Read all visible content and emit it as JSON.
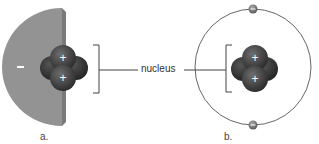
{
  "diagram": {
    "center_label": "nucleus",
    "panels": [
      {
        "id": "a",
        "caption": "a.",
        "cloud_sign": "−",
        "nucleus_signs": [
          "+",
          "+"
        ],
        "description": "electron cloud model (half sphere) with nucleus of two protons and two neutrons"
      },
      {
        "id": "b",
        "caption": "b.",
        "electron_sign": "−",
        "nucleus_signs": [
          "+",
          "+"
        ],
        "electrons": 2,
        "description": "Bohr-style orbit model with two electrons on a circular orbit around nucleus"
      }
    ],
    "colors": {
      "cloud": "#8f8f8f",
      "cloud_edge": "#7a7a7a",
      "nucleus_dark": "#3f3f3f",
      "nucleus_mid": "#5a5a5a",
      "orbit": "#555555",
      "electron": "#7d7d7d",
      "bracket": "#444444"
    }
  }
}
